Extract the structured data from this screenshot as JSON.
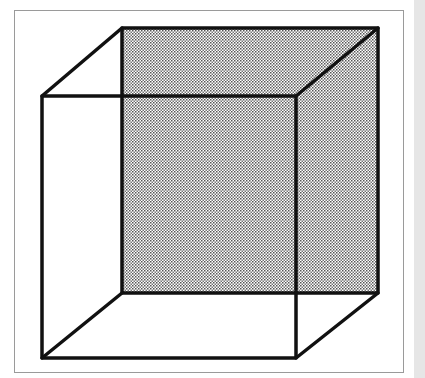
{
  "figure": {
    "shaded_face": "back",
    "colors": {
      "line": "#111111",
      "shade_dot": "#555555",
      "frame": "#9a9a9a",
      "side_strip": "#e6e6e6"
    },
    "front_square": {
      "x1": 42,
      "y1": 96,
      "x2": 296,
      "y2": 358
    },
    "back_square": {
      "x1": 122,
      "y1": 28,
      "x2": 378,
      "y2": 293
    }
  }
}
